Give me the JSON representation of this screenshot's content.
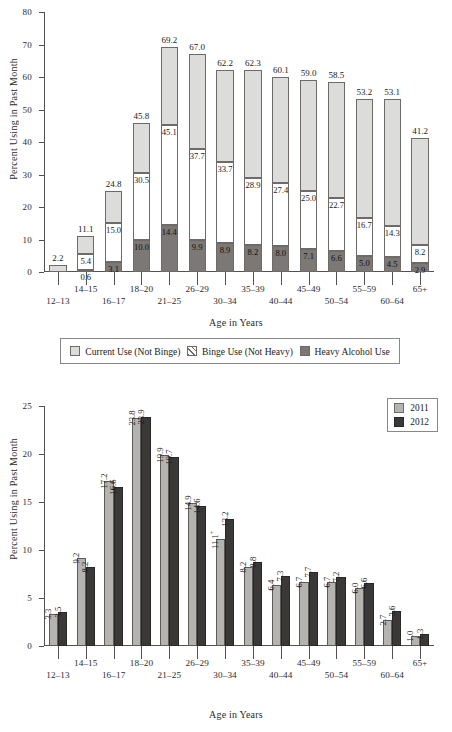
{
  "charts": {
    "top": {
      "ylabel": "Percent Using in Past Month",
      "xlabel": "Age in Years",
      "legend": [
        {
          "key": "current",
          "label": "Current Use (Not Binge)"
        },
        {
          "key": "binge",
          "label": "Binge Use (Not Heavy)"
        },
        {
          "key": "heavy",
          "label": "Heavy Alcohol Use"
        }
      ]
    },
    "bottom": {
      "ylabel": "Percent Using in Past Month",
      "xlabel": "Age in Years",
      "legend": [
        {
          "key": "y2011",
          "label": "2011"
        },
        {
          "key": "y2012",
          "label": "2012"
        }
      ]
    }
  },
  "chart_data": [
    {
      "type": "bar",
      "subtype": "stacked",
      "title": "",
      "xlabel": "Age in Years",
      "ylabel": "Percent Using in Past Month",
      "ylim": [
        0,
        80
      ],
      "yticks": [
        0,
        10,
        20,
        30,
        40,
        50,
        60,
        70,
        80
      ],
      "grid": false,
      "legend_position": "below",
      "categories": [
        "12–13",
        "14–15",
        "16–17",
        "18–20",
        "21–25",
        "26–29",
        "30–34",
        "35–39",
        "40–44",
        "45–49",
        "50–54",
        "55–59",
        "60–64",
        "65+"
      ],
      "series": [
        {
          "name": "Heavy Alcohol Use",
          "values": [
            0.0,
            0.6,
            3.1,
            10.0,
            14.4,
            9.9,
            8.9,
            8.2,
            8.0,
            7.1,
            6.6,
            5.0,
            4.5,
            2.9
          ]
        },
        {
          "name": "Binge Use (Not Heavy)",
          "values": [
            0.0,
            5.4,
            15.0,
            30.5,
            45.1,
            37.7,
            33.7,
            28.9,
            27.4,
            25.0,
            22.7,
            16.7,
            14.3,
            8.2
          ]
        },
        {
          "name": "Current Use (Not Binge)",
          "values": [
            2.2,
            11.1,
            24.8,
            45.8,
            69.2,
            67.0,
            62.2,
            62.3,
            60.1,
            59.0,
            58.5,
            53.2,
            53.1,
            41.2
          ]
        }
      ],
      "note": "Series values are cumulative tops: heavy = bottom segment top, binge = heavy+binge top, current = full bar total."
    },
    {
      "type": "bar",
      "subtype": "grouped",
      "title": "",
      "xlabel": "Age in Years",
      "ylabel": "Percent Using in Past Month",
      "ylim": [
        0,
        25
      ],
      "yticks": [
        0,
        5,
        10,
        15,
        20,
        25
      ],
      "grid": false,
      "legend_position": "top-right",
      "categories": [
        "12–13",
        "14–15",
        "16–17",
        "18–20",
        "21–25",
        "26–29",
        "30–34",
        "35–39",
        "40–44",
        "45–49",
        "50–54",
        "55–59",
        "60–64",
        "65+"
      ],
      "series": [
        {
          "name": "2011",
          "values": [
            3.3,
            9.2,
            17.2,
            23.8,
            19.9,
            14.9,
            11.1,
            8.2,
            6.4,
            6.7,
            6.7,
            6.0,
            2.7,
            1.0
          ],
          "value_labels": [
            "3.3",
            "9.2",
            "17.2",
            "23.8",
            "19.9",
            "14.9",
            "11.1+",
            "8.2",
            "6.4",
            "6.7",
            "6.7",
            "6.0",
            "2.7",
            "1.0"
          ]
        },
        {
          "name": "2012",
          "values": [
            3.5,
            8.2,
            16.6,
            23.9,
            19.7,
            14.6,
            13.2,
            8.8,
            7.3,
            7.7,
            7.2,
            6.6,
            3.6,
            1.3
          ],
          "value_labels": [
            "3.5",
            "8.2",
            "16.6",
            "23.9",
            "19.7",
            "14.6",
            "13.2",
            "8.8",
            "7.3",
            "7.7",
            "7.2",
            "6.6",
            "3.6",
            "1.3"
          ]
        }
      ]
    }
  ],
  "colors": {
    "current_use": "#dcdcda",
    "heavy_use": "#7b7875",
    "year_2011": "#b5b3b0",
    "year_2012": "#3b3937",
    "axis": "#55514e",
    "text": "#1a1a1a"
  }
}
